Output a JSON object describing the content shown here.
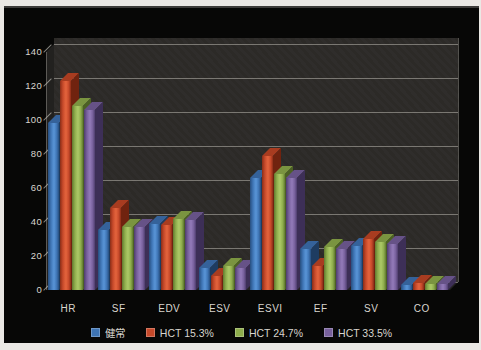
{
  "figure": {
    "background": "#070706",
    "frame_color": "#eae8e4",
    "wall_color": "#2d2b28",
    "grid_color": "#b9b7af",
    "text_color": "#d9d6cf"
  },
  "chart_data": {
    "type": "bar",
    "style": "3d-clustered",
    "title": "",
    "xlabel": "",
    "ylabel": "",
    "categories": [
      "HR",
      "SF",
      "EDV",
      "ESV",
      "ESVI",
      "EF",
      "SV",
      "CO"
    ],
    "series": [
      {
        "name": "健常",
        "values": [
          98,
          35,
          39,
          13,
          66,
          24,
          26,
          3
        ],
        "color": "#3e74b4",
        "color_light": "#5590d2",
        "color_dark": "#274e7e",
        "color_top": "#35629a",
        "color_side": "#1e3c61"
      },
      {
        "name": "HCT 15.3%",
        "values": [
          123,
          48,
          38,
          8,
          79,
          14,
          30,
          4
        ],
        "color": "#c6492a",
        "color_light": "#e0603a",
        "color_dark": "#8a2d17",
        "color_top": "#a83c20",
        "color_side": "#70230f"
      },
      {
        "name": "HCT 24.7%",
        "values": [
          108,
          37,
          42,
          14,
          68,
          25,
          28,
          3.5
        ],
        "color": "#8ead4c",
        "color_light": "#a8c563",
        "color_dark": "#60792f",
        "color_top": "#7a9440",
        "color_side": "#4c6124"
      },
      {
        "name": "HCT 33.5%",
        "values": [
          106,
          37,
          41,
          13,
          66,
          24,
          27,
          3.5
        ],
        "color": "#77609c",
        "color_light": "#8f77b5",
        "color_dark": "#4e3d6d",
        "color_top": "#665287",
        "color_side": "#3d2f57"
      }
    ],
    "ylim": [
      0,
      140
    ],
    "ytick_step": 20,
    "ytick_labels": [
      "0",
      "20",
      "40",
      "60",
      "80",
      "100",
      "120",
      "140"
    ],
    "grid": "horizontal",
    "legend_position": "bottom"
  }
}
